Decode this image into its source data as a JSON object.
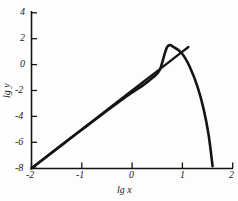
{
  "chart_data": {
    "type": "line",
    "title": "",
    "subtitle": "",
    "xlabel": "lg x",
    "ylabel": "lg y",
    "xlim": [
      -2,
      2
    ],
    "ylim": [
      -8,
      4
    ],
    "grid": false,
    "legend": "none",
    "xticks": [
      -2,
      -1,
      0,
      1,
      2
    ],
    "xtick_labels": [
      "-2",
      "-1",
      "0",
      "1",
      "2"
    ],
    "yticks": [
      4,
      2,
      0,
      -2,
      -4,
      -6,
      -8
    ],
    "ytick_labels": [
      "4",
      "2",
      "0",
      "-2",
      "-4",
      "-6",
      "-8"
    ],
    "series": [
      {
        "name": "asymptote-line",
        "style": "straight-line",
        "color": "#141414",
        "x": [
          -2.0,
          -1.5,
          -1.0,
          -0.5,
          0.0,
          0.5,
          1.0,
          1.12
        ],
        "values": [
          -8.0,
          -6.5,
          -5.0,
          -3.5,
          -2.0,
          -0.5,
          1.0,
          1.36
        ]
      },
      {
        "name": "curve",
        "style": "curved",
        "color": "#141414",
        "x": [
          -2.0,
          -1.75,
          -1.5,
          -1.25,
          -1.0,
          -0.75,
          -0.5,
          -0.25,
          0.0,
          0.2,
          0.4,
          0.55,
          0.7,
          0.85,
          1.0,
          1.15,
          1.3,
          1.42,
          1.52,
          1.6
        ],
        "values": [
          -8.02,
          -7.27,
          -6.52,
          -5.77,
          -5.03,
          -4.29,
          -3.56,
          -2.84,
          -2.15,
          -1.64,
          -1.03,
          -0.42,
          1.38,
          1.3,
          0.82,
          -0.2,
          -1.7,
          -3.4,
          -5.4,
          -7.85
        ]
      }
    ],
    "annotations": {
      "peak": {
        "x": 0.7,
        "y": 1.4
      },
      "tangency_note": "curve follows the straight line at small lg x then falls steeply"
    }
  }
}
